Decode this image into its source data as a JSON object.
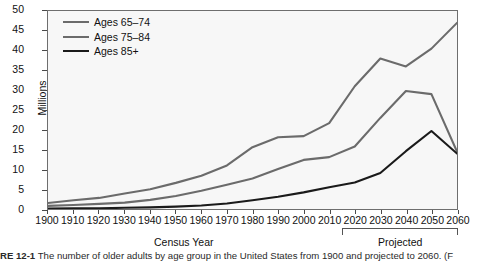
{
  "figure": {
    "caption_prefix": "RE 12-1",
    "caption_text": "The number of older adults by age group in the United States from 1900 and projected to 2060. (F"
  },
  "axes": {
    "ylabel": "Millions",
    "xlabel": "Census Year",
    "yticks": [
      "0",
      "5",
      "10",
      "15",
      "20",
      "25",
      "30",
      "35",
      "40",
      "45",
      "50"
    ],
    "xticks": [
      "1900",
      "1910",
      "1920",
      "1930",
      "1940",
      "1950",
      "1960",
      "1970",
      "1980",
      "1990",
      "2000",
      "2010",
      "2020",
      "2030",
      "2040",
      "2050",
      "2060"
    ],
    "projected_label": "Projected"
  },
  "colors": {
    "series_65_74": "#6b6b6b",
    "series_75_84": "#6b6b6b",
    "series_85_plus": "#1a1a1a",
    "plot_background": "#f7f7f7",
    "axis": "#6e6e6e"
  },
  "chart_data": {
    "type": "line",
    "title": "",
    "xlabel": "Census Year",
    "ylabel": "Millions",
    "xlim": [
      1900,
      2060
    ],
    "ylim": [
      0,
      50
    ],
    "grid": false,
    "legend_position": "upper left",
    "x": [
      1900,
      1910,
      1920,
      1930,
      1940,
      1950,
      1960,
      1970,
      1980,
      1990,
      2000,
      2010,
      2020,
      2030,
      2040,
      2050,
      2060
    ],
    "series": [
      {
        "name": "Ages 65–74",
        "values": [
          1.5,
          2.2,
          2.8,
          3.9,
          5.0,
          6.6,
          8.4,
          11.0,
          15.6,
          18.1,
          18.4,
          21.7,
          31.0,
          38.0,
          36.0,
          40.5,
          47.0
        ]
      },
      {
        "name": "Ages 75–84",
        "values": [
          0.8,
          1.0,
          1.3,
          1.6,
          2.3,
          3.3,
          4.6,
          6.1,
          7.7,
          10.1,
          12.4,
          13.1,
          15.8,
          23.0,
          29.8,
          29.0,
          14.5
        ]
      },
      {
        "name": "Ages 85+",
        "values": [
          0.1,
          0.2,
          0.2,
          0.3,
          0.4,
          0.6,
          0.9,
          1.4,
          2.2,
          3.1,
          4.2,
          5.5,
          6.7,
          9.1,
          14.6,
          19.7,
          14.0
        ]
      }
    ],
    "annotations": [
      {
        "text": "Projected",
        "x_range": [
          2015,
          2060
        ]
      }
    ]
  },
  "legend": {
    "items": [
      {
        "label": "Ages 65–74"
      },
      {
        "label": "Ages 75–84"
      },
      {
        "label": "Ages 85+"
      }
    ]
  }
}
